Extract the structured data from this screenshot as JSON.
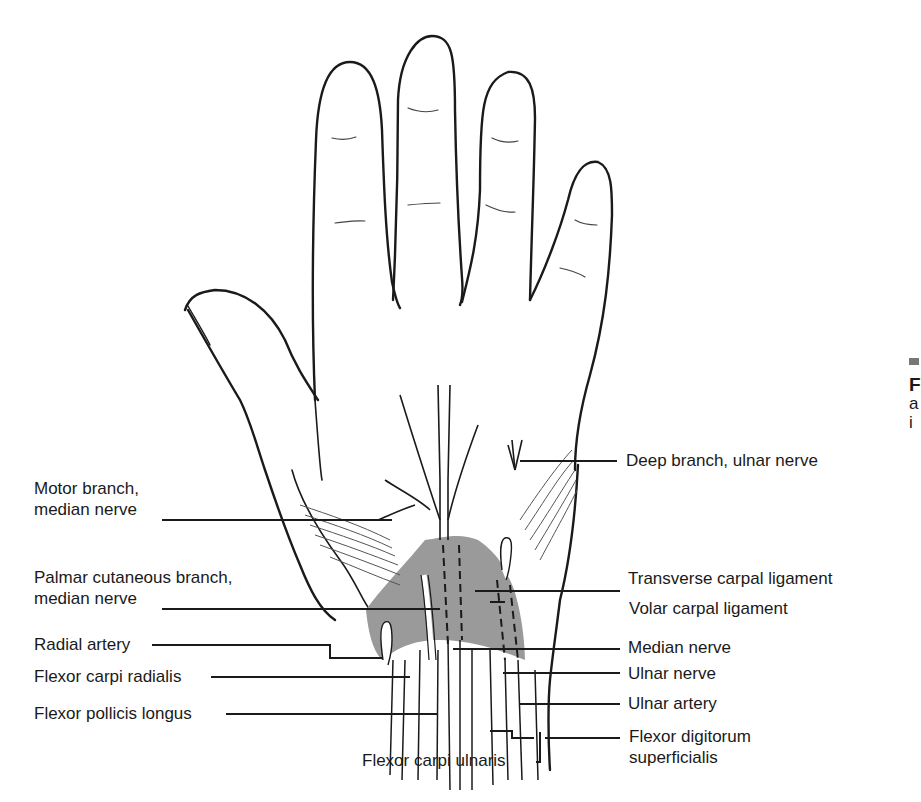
{
  "figure": {
    "colors": {
      "outline": "#1a1a1a",
      "ligament_fill": "#9a9a9a",
      "background": "#ffffff",
      "caption_marker": "#777777"
    }
  },
  "labels_left": [
    {
      "id": "motor-branch",
      "lines": [
        "Motor branch,",
        "median nerve"
      ]
    },
    {
      "id": "palmar-cutaneous-branch",
      "lines": [
        "Palmar cutaneous branch,",
        "median nerve"
      ]
    },
    {
      "id": "radial-artery",
      "lines": [
        "Radial artery"
      ]
    },
    {
      "id": "flexor-carpi-radialis",
      "lines": [
        "Flexor carpi radialis"
      ]
    },
    {
      "id": "flexor-pollicis-longus",
      "lines": [
        "Flexor pollicis longus"
      ]
    }
  ],
  "labels_right": [
    {
      "id": "deep-branch-ulnar",
      "lines": [
        "Deep branch, ulnar nerve"
      ]
    },
    {
      "id": "transverse-carpal-ligament",
      "lines": [
        "Transverse carpal ligament"
      ]
    },
    {
      "id": "volar-carpal-ligament",
      "lines": [
        "Volar carpal ligament"
      ]
    },
    {
      "id": "median-nerve",
      "lines": [
        "Median nerve"
      ]
    },
    {
      "id": "ulnar-nerve",
      "lines": [
        "Ulnar nerve"
      ]
    },
    {
      "id": "ulnar-artery",
      "lines": [
        "Ulnar artery"
      ]
    },
    {
      "id": "flexor-digitorum-superficialis",
      "lines": [
        "Flexor digitorum",
        "superficialis"
      ]
    }
  ],
  "labels_bottom": [
    {
      "id": "flexor-carpi-ulnaris",
      "lines": [
        "Flexor carpi ulnaris"
      ]
    }
  ],
  "side_caption": {
    "visible_fragments": [
      "F",
      "a",
      "i"
    ]
  }
}
